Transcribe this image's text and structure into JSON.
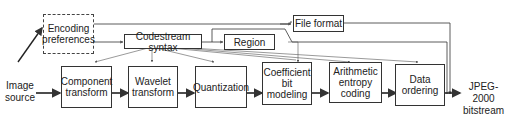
{
  "diagram": {
    "input": {
      "line1": "Image",
      "line2": "source"
    },
    "output": {
      "line1": "JPEG-2000",
      "line2": "bitstream"
    },
    "control_blocks": {
      "encoding_preferences": {
        "line1": "Encoding",
        "line2": "preferences"
      },
      "codestream_syntax": {
        "label": "Codestream syntax"
      },
      "region": {
        "label": "Region"
      },
      "file_format": {
        "label": "File format"
      }
    },
    "pipeline": [
      {
        "line1": "Component",
        "line2": "transform"
      },
      {
        "line1": "Wavelet",
        "line2": "transform"
      },
      {
        "line1": "Quantization",
        "line2": ""
      },
      {
        "line1": "Coefficient",
        "line2": "bit modeling"
      },
      {
        "line1": "Arithmetic",
        "line2": "entropy",
        "line3": "coding"
      },
      {
        "line1": "Data",
        "line2": "ordering"
      }
    ],
    "colors": {
      "line": "#333333",
      "background": "#ffffff"
    }
  }
}
